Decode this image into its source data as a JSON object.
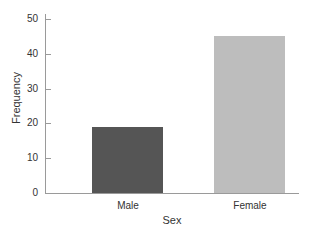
{
  "chart_data": {
    "type": "bar",
    "title": "",
    "xlabel": "Sex",
    "ylabel": "Frequency",
    "categories": [
      "Male",
      "Female"
    ],
    "values": [
      19,
      45
    ],
    "colors": [
      "#555555",
      "#bdbdbd"
    ],
    "ylim": [
      0,
      50
    ],
    "yticks": [
      0,
      10,
      20,
      30,
      40,
      50
    ],
    "grid": false,
    "legend": null
  },
  "labels": {
    "yticks": [
      "0",
      "10",
      "20",
      "30",
      "40",
      "50"
    ],
    "categories": [
      "Male",
      "Female"
    ],
    "xlabel": "Sex",
    "ylabel": "Frequency"
  }
}
